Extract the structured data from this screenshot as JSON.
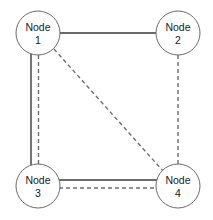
{
  "diagram": {
    "type": "network-graph",
    "title": "",
    "canvas": {
      "width": 213,
      "height": 220,
      "background": "#ffffff"
    },
    "nodes": [
      {
        "id": "node-1",
        "label": "Node",
        "number": "1",
        "cx": 38,
        "cy": 33,
        "r": 22
      },
      {
        "id": "node-2",
        "label": "Node",
        "number": "2",
        "cx": 178,
        "cy": 33,
        "r": 22
      },
      {
        "id": "node-3",
        "label": "Node",
        "number": "3",
        "cx": 38,
        "cy": 186,
        "r": 22
      },
      {
        "id": "node-4",
        "label": "Node",
        "number": "4",
        "cx": 178,
        "cy": 186,
        "r": 22
      }
    ],
    "edges": [
      {
        "id": "edge-1-2",
        "from": "node-1",
        "to": "node-2",
        "style": "solid",
        "orientation": "horizontal"
      },
      {
        "id": "edge-1-3-solid",
        "from": "node-1",
        "to": "node-3",
        "style": "solid",
        "orientation": "vertical"
      },
      {
        "id": "edge-1-3-dashed",
        "from": "node-1",
        "to": "node-3",
        "style": "dashed",
        "orientation": "vertical"
      },
      {
        "id": "edge-1-4-dashed",
        "from": "node-1",
        "to": "node-4",
        "style": "dashed",
        "orientation": "diagonal"
      },
      {
        "id": "edge-2-4-dashed",
        "from": "node-2",
        "to": "node-4",
        "style": "dashed",
        "orientation": "vertical"
      },
      {
        "id": "edge-3-4-solid",
        "from": "node-3",
        "to": "node-4",
        "style": "solid",
        "orientation": "horizontal"
      },
      {
        "id": "edge-3-4-dashed",
        "from": "node-3",
        "to": "node-4",
        "style": "dashed",
        "orientation": "horizontal"
      }
    ],
    "colors": {
      "node_stroke": "#6b6b6b",
      "node_fill": "#ffffff",
      "solid_edge": "#3a3a3a",
      "dashed_edge": "#6e6e74",
      "label_text": "#1a1a1a"
    }
  }
}
